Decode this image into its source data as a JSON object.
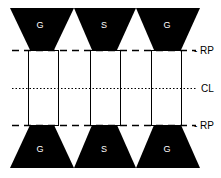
{
  "diagram": {
    "top_shapes": [
      {
        "label": "G"
      },
      {
        "label": "S"
      },
      {
        "label": "G"
      }
    ],
    "bottom_shapes": [
      {
        "label": "G"
      },
      {
        "label": "S"
      },
      {
        "label": "G"
      }
    ],
    "lines": {
      "top_rp": "- RP",
      "center": "CL",
      "bottom_rp": "- RP"
    },
    "colors": {
      "fill": "#000000",
      "background": "#ffffff",
      "line": "#000000"
    }
  }
}
